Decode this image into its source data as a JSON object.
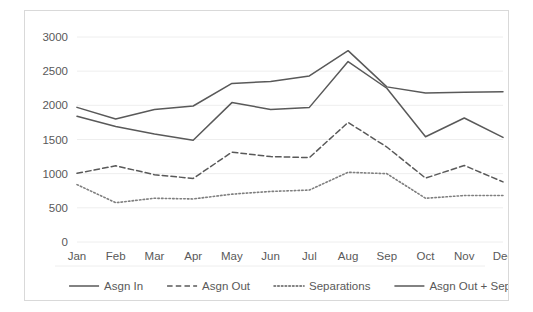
{
  "chart_data": {
    "type": "line",
    "title": "",
    "xlabel": "",
    "ylabel": "",
    "categories": [
      "Jan",
      "Feb",
      "Mar",
      "Apr",
      "May",
      "Jun",
      "Jul",
      "Aug",
      "Sep",
      "Oct",
      "Nov",
      "Dec"
    ],
    "ylim": [
      0,
      3000
    ],
    "yticks": [
      0,
      500,
      1000,
      1500,
      2000,
      2500,
      3000
    ],
    "ytick_labels": [
      "0",
      "500",
      "1000",
      "1500",
      "2000",
      "2500",
      "3000"
    ],
    "grid": "horizontal",
    "legend_position": "bottom",
    "series": [
      {
        "name": "Asgn In",
        "style": "solid",
        "color": "#595959",
        "values": [
          1970,
          1800,
          1940,
          1990,
          2320,
          2350,
          2430,
          2800,
          2270,
          2180,
          2190,
          2200
        ]
      },
      {
        "name": "Asgn Out",
        "style": "dashed",
        "color": "#595959",
        "values": [
          1005,
          1115,
          985,
          930,
          1315,
          1250,
          1235,
          1750,
          1390,
          935,
          1120,
          880
        ]
      },
      {
        "name": "Separations",
        "style": "dotted",
        "color": "#7f7f7f",
        "values": [
          840,
          575,
          640,
          630,
          700,
          740,
          760,
          1020,
          1000,
          640,
          680,
          680
        ]
      },
      {
        "name": "Asgn Out + Sep",
        "style": "solid",
        "color": "#595959",
        "values": [
          1840,
          1690,
          1580,
          1490,
          2040,
          1940,
          1970,
          2640,
          2250,
          1540,
          1815,
          1530
        ]
      }
    ]
  },
  "legend": {
    "items": [
      {
        "label": "Asgn In",
        "style": "solid"
      },
      {
        "label": "Asgn Out",
        "style": "dashed"
      },
      {
        "label": "Separations",
        "style": "dotted"
      },
      {
        "label": "Asgn Out + Sep",
        "style": "solid"
      }
    ]
  },
  "colors": {
    "line": "#595959",
    "grid": "#eeeeee",
    "border": "#d9d9d9",
    "text": "#595959",
    "background": "#ffffff"
  }
}
